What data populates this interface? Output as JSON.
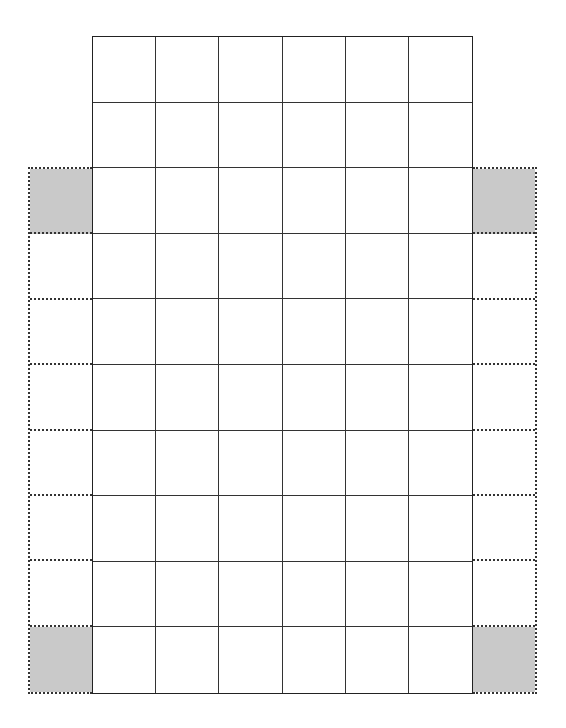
{
  "diagram": {
    "type": "grid",
    "main_grid": {
      "columns": 6,
      "rows": 10,
      "border_style": "solid",
      "cell_fill": "#ffffff"
    },
    "side_columns": {
      "left": {
        "rows": 8,
        "start_row": 3,
        "end_row": 10,
        "border_style": "dotted",
        "shaded_rows": [
          3,
          10
        ]
      },
      "right": {
        "rows": 8,
        "start_row": 3,
        "end_row": 10,
        "border_style": "dotted",
        "shaded_rows": [
          3,
          10
        ]
      }
    },
    "colors": {
      "line": "#333333",
      "shade": "#c9c9c9",
      "background": "#ffffff"
    }
  }
}
